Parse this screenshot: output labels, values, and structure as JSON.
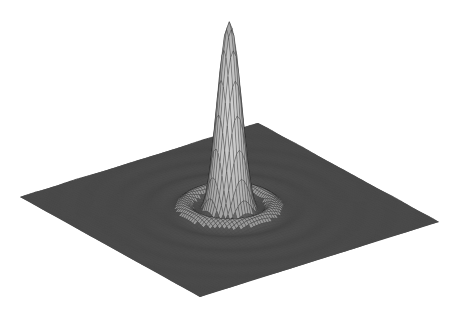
{
  "chart_data": {
    "type": "surface",
    "title": "",
    "xlabel": "",
    "ylabel": "",
    "zlabel": "",
    "function": "central peak with concentric ripples (sinc/Airy-like point spread function)",
    "grid": false,
    "legend": null,
    "axes_visible": false,
    "z_range": [
      0,
      1
    ],
    "peak": {
      "x": 0,
      "y": 0,
      "z": 1.0
    },
    "ripple_amplitude_relative": 0.08,
    "side_lobes": [
      {
        "position": "left",
        "z": 0.12
      },
      {
        "position": "right",
        "z": 0.12
      },
      {
        "position": "front",
        "z": 0.12
      },
      {
        "position": "back",
        "z": 0.1
      }
    ],
    "projection": {
      "plane_corners_px": {
        "left": [
          20,
          197
        ],
        "top": [
          258,
          123
        ],
        "right": [
          439,
          222
        ],
        "bottom": [
          200,
          297
        ]
      },
      "peak_tip_px": [
        229,
        17
      ],
      "peak_base_center_px": [
        229,
        205
      ]
    },
    "colors": {
      "background": "#ffffff",
      "plane": "#4a4a4a",
      "mesh_dark": "#1a1a1a",
      "mesh_light": "#e8e8e8"
    }
  }
}
